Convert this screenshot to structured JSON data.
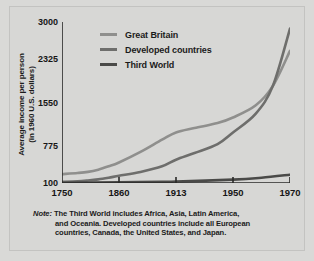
{
  "chart_data": {
    "type": "line",
    "title": "",
    "xlabel": "",
    "ylabel": "Average income per person (in 1960 U.S. dollars)",
    "ylabel_line1": "Average income per person",
    "ylabel_line2": "(in 1960 U.S. dollars)",
    "categories": [
      "1750",
      "1860",
      "1913",
      "1950",
      "1970"
    ],
    "x_ticks": [
      1750,
      1860,
      1913,
      1950,
      1970
    ],
    "y_ticks": [
      100,
      775,
      1550,
      2325,
      3000
    ],
    "ylim": [
      100,
      3000
    ],
    "grid": false,
    "legend_position": "top-left",
    "axis_style": "evenly-spaced-categorical",
    "series": [
      {
        "name": "Great Britain",
        "color": "#8f8f8d",
        "x": [
          1750,
          1780,
          1800,
          1820,
          1840,
          1860,
          1880,
          1900,
          1913,
          1925,
          1940,
          1950,
          1958,
          1964,
          1970
        ],
        "values": [
          260,
          280,
          300,
          340,
          400,
          470,
          660,
          880,
          1010,
          1090,
          1180,
          1280,
          1500,
          1850,
          2480
        ]
      },
      {
        "name": "Developed countries",
        "color": "#6e6e6c",
        "x": [
          1750,
          1780,
          1800,
          1820,
          1840,
          1860,
          1880,
          1900,
          1913,
          1925,
          1940,
          1950,
          1958,
          1964,
          1970
        ],
        "values": [
          120,
          130,
          145,
          165,
          195,
          230,
          300,
          400,
          520,
          640,
          800,
          1010,
          1350,
          1850,
          2880
        ]
      },
      {
        "name": "Third World",
        "color": "#4a4a48",
        "x": [
          1750,
          1800,
          1860,
          1900,
          1913,
          1950,
          1960,
          1970
        ],
        "values": [
          105,
          108,
          112,
          120,
          128,
          160,
          195,
          250
        ]
      }
    ],
    "note_label": "Note:",
    "note_text": "The Third World includes Africa, Asia, Latin America, and Oceania. Developed countries include all European countries, Canada, the United States, and Japan.",
    "note_line1": "The Third World includes Africa, Asia, Latin America,",
    "note_line2": "and Oceania. Developed countries include all European",
    "note_line3": "countries, Canada, the United States, and Japan."
  },
  "colors": {
    "background": "#d9d9d7",
    "panel": "#d7d7d5",
    "axis": "#2a2a28",
    "text": "#1b1b1b",
    "great_britain": "#8f8f8d",
    "developed_countries": "#6e6e6c",
    "third_world": "#4a4a48"
  }
}
